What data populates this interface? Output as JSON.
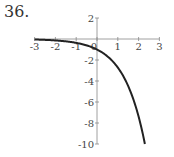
{
  "problem_label": "36.",
  "chart_data": {
    "type": "line",
    "title": "",
    "function": "y = -e^x",
    "xlabel": "",
    "ylabel": "",
    "xlim": [
      -3,
      3
    ],
    "ylim": [
      -10,
      2
    ],
    "x_ticks": [
      -3,
      -2,
      -1,
      0,
      1,
      2,
      3
    ],
    "y_ticks": [
      2,
      -2,
      -4,
      -6,
      -8,
      -10
    ],
    "grid": false,
    "legend": null,
    "series": [
      {
        "name": "y = -e^x",
        "x": [
          -3,
          -2.5,
          -2,
          -1.5,
          -1,
          -0.5,
          0,
          0.5,
          1,
          1.5,
          2,
          2.3
        ],
        "values": [
          -0.05,
          -0.08,
          -0.14,
          -0.22,
          -0.37,
          -0.61,
          -1,
          -1.65,
          -2.72,
          -4.48,
          -7.39,
          -9.97
        ]
      }
    ]
  }
}
